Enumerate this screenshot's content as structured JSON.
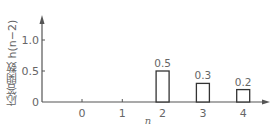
{
  "chart_data": {
    "type": "bar",
    "title": "",
    "xlabel": "n",
    "ylabel": "応答関数 h(n−2)",
    "x": [
      0,
      1,
      2,
      3,
      4
    ],
    "categories": [
      "0",
      "1",
      "2",
      "3",
      "4"
    ],
    "values": [
      0,
      0,
      0.5,
      0.3,
      0.2
    ],
    "data_labels": [
      "",
      "",
      "0.5",
      "0.3",
      "0.2"
    ],
    "y_ticks": [
      "0",
      "0.5",
      "1.0"
    ],
    "ylim": [
      0,
      1.3
    ],
    "grid": false,
    "legend": null
  },
  "colors": {
    "axis": "#555555",
    "bar_stroke": "#333333",
    "bar_fill": "#ffffff",
    "text": "#666666"
  }
}
